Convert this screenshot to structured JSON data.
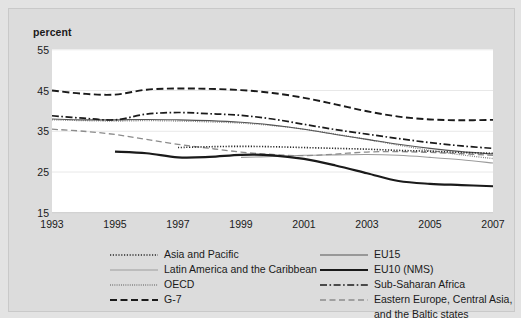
{
  "chart_data": {
    "type": "line",
    "title": "",
    "subtitle": "",
    "xlabel": "",
    "ylabel": "percent",
    "ylim": [
      15,
      55
    ],
    "xlim": [
      1993,
      2007
    ],
    "yticks": [
      55,
      45,
      35,
      25,
      15
    ],
    "xticks": [
      1993,
      1995,
      1997,
      1999,
      2001,
      2003,
      2005,
      2007
    ],
    "grid": "horizontal",
    "legend_position": "below",
    "series": [
      {
        "name": "Asia and Pacific",
        "style": "dotted",
        "color": "#2b2b2b",
        "x": [
          1997,
          1998,
          1999,
          2000,
          2001,
          2002,
          2003,
          2004,
          2005,
          2006,
          2007
        ],
        "values": [
          31.0,
          31.2,
          31.3,
          31.2,
          31.0,
          30.8,
          30.6,
          30.3,
          30.1,
          29.8,
          29.6
        ]
      },
      {
        "name": "Latin America and the Caribbean",
        "style": "solid-light",
        "color": "#9b9b9b",
        "x": [
          1999,
          2000,
          2001,
          2002,
          2003,
          2004,
          2005,
          2006,
          2007
        ],
        "values": [
          28.6,
          28.8,
          29.1,
          29.2,
          29.3,
          29.1,
          28.6,
          28.0,
          27.2
        ]
      },
      {
        "name": "OECD",
        "style": "fine-dotted",
        "color": "#7a7a7a",
        "x": [
          1993,
          1994,
          1995,
          1996,
          1997,
          1998,
          1999,
          2000,
          2001,
          2002,
          2003,
          2004,
          2005,
          2006,
          2007
        ],
        "values": [
          37.8,
          37.6,
          37.5,
          37.6,
          37.5,
          37.3,
          37.0,
          36.4,
          35.5,
          34.3,
          33.0,
          31.6,
          30.3,
          29.2,
          28.3
        ]
      },
      {
        "name": "G-7",
        "style": "dashed-bold",
        "color": "#1a1a1a",
        "x": [
          1993,
          1994,
          1995,
          1996,
          1997,
          1998,
          1999,
          2000,
          2001,
          2002,
          2003,
          2004,
          2005,
          2006,
          2007
        ],
        "values": [
          45.0,
          44.2,
          44.0,
          45.2,
          45.5,
          45.4,
          45.1,
          44.4,
          43.2,
          41.6,
          39.9,
          38.6,
          37.9,
          37.7,
          37.8
        ]
      },
      {
        "name": "EU15",
        "style": "solid-thin",
        "color": "#555555",
        "x": [
          1993,
          1994,
          1995,
          1996,
          1997,
          1998,
          1999,
          2000,
          2001,
          2002,
          2003,
          2004,
          2005,
          2006,
          2007
        ],
        "values": [
          38.0,
          37.8,
          37.8,
          37.9,
          37.8,
          37.6,
          37.2,
          36.5,
          35.5,
          34.2,
          33.0,
          31.8,
          30.8,
          30.0,
          29.4
        ]
      },
      {
        "name": "EU10 (NMS)",
        "style": "solid-bold",
        "color": "#1a1a1a",
        "x": [
          1995,
          1996,
          1997,
          1998,
          1999,
          2000,
          2001,
          2002,
          2003,
          2004,
          2005,
          2006,
          2007
        ],
        "values": [
          30.0,
          29.6,
          28.6,
          28.7,
          29.2,
          29.1,
          28.2,
          26.6,
          24.7,
          22.8,
          22.1,
          21.8,
          21.5
        ]
      },
      {
        "name": "Sub-Saharan Africa",
        "style": "dash-dot",
        "color": "#1a1a1a",
        "x": [
          1993,
          1994,
          1995,
          1996,
          1997,
          1998,
          1999,
          2000,
          2001,
          2002,
          2003,
          2004,
          2005,
          2006,
          2007
        ],
        "values": [
          38.8,
          38.2,
          37.8,
          39.2,
          39.6,
          39.3,
          38.9,
          38.0,
          36.7,
          35.4,
          34.3,
          33.2,
          32.2,
          31.4,
          30.8
        ]
      },
      {
        "name": "Eastern Europe, Central Asia, and the Baltic states",
        "style": "long-dash",
        "color": "#8c8c8c",
        "x": [
          1993,
          1994,
          1995,
          1996,
          1997,
          1998,
          1999,
          2000,
          2001,
          2002,
          2003,
          2004,
          2005,
          2006,
          2007
        ],
        "values": [
          35.5,
          35.0,
          34.2,
          33.0,
          31.8,
          30.8,
          29.9,
          29.3,
          29.0,
          29.4,
          29.9,
          30.0,
          29.8,
          29.5,
          29.1
        ]
      }
    ]
  },
  "axis": {
    "ylabel": "percent",
    "ytick_labels": [
      "55",
      "45",
      "35",
      "25",
      "15"
    ],
    "xtick_labels": [
      "1993",
      "1995",
      "1997",
      "1999",
      "2001",
      "2003",
      "2005",
      "2007"
    ]
  },
  "legend": {
    "left_column": [
      {
        "label": "Asia and Pacific",
        "key": "dotted"
      },
      {
        "label": "Latin America and the Caribbean",
        "key": "solid-light"
      },
      {
        "label": "OECD",
        "key": "fine-dotted"
      },
      {
        "label": "G-7",
        "key": "dashed-bold"
      }
    ],
    "right_column": [
      {
        "label": "EU15",
        "key": "solid-thin"
      },
      {
        "label": "EU10 (NMS)",
        "key": "solid-bold"
      },
      {
        "label": "Sub-Saharan Africa",
        "key": "dash-dot"
      },
      {
        "label": "Eastern Europe, Central Asia,",
        "key": "long-dash"
      },
      {
        "label": "and the Baltic states",
        "key": "none"
      }
    ]
  }
}
